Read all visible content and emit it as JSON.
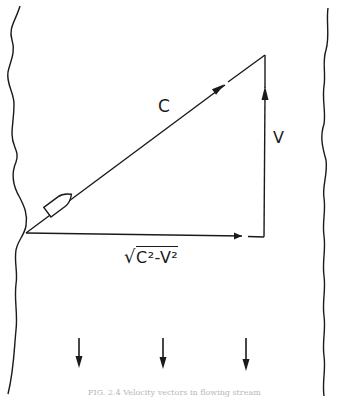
{
  "figure": {
    "labels": {
      "resultant": "C",
      "current": "V",
      "cross_component_radical": "√",
      "cross_component": "C²-V²"
    },
    "caption": "FIG. 2.4   Velocity vectors in flowing stream"
  },
  "colors": {
    "ink": "#1a1a1a",
    "background": "#ffffff",
    "caption": "#b8b8b8"
  }
}
